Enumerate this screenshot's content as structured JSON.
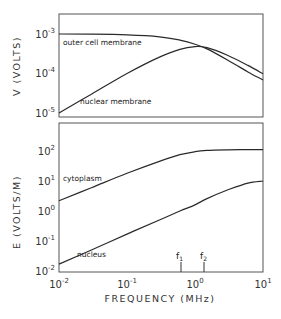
{
  "chart_data": [
    {
      "type": "line",
      "panel": "top",
      "title": "",
      "xlabel": "FREQUENCY (MHz)",
      "ylabel": "V (VOLTS)",
      "xscale": "log",
      "yscale": "log",
      "xlim": [
        0.01,
        10
      ],
      "ylim": [
        5e-06,
        0.0025
      ],
      "x_ticks": [
        "10^-2",
        "10^-1",
        "10^0",
        "10^1"
      ],
      "y_ticks": [
        "10^-3",
        "10^-4",
        "10^-5"
      ],
      "grid": false,
      "series": [
        {
          "name": "outer cell membrane",
          "x": [
            0.01,
            0.03,
            0.1,
            0.3,
            0.6,
            1.0,
            1.5,
            3,
            6,
            10
          ],
          "y": [
            0.001,
            0.00099,
            0.00095,
            0.00085,
            0.0007,
            0.00055,
            0.00042,
            0.00022,
            0.00011,
            6.8e-05
          ]
        },
        {
          "name": "nuclear membrane",
          "x": [
            0.01,
            0.03,
            0.1,
            0.3,
            0.6,
            1.0,
            1.5,
            3,
            6,
            10
          ],
          "y": [
            1e-05,
            3e-05,
            0.0001,
            0.00026,
            0.00041,
            0.00048,
            0.00045,
            0.00029,
            0.00016,
            9.8e-05
          ]
        }
      ]
    },
    {
      "type": "line",
      "panel": "bottom",
      "title": "",
      "xlabel": "FREQUENCY (MHz)",
      "ylabel": "E (VOLTS/M)",
      "xscale": "log",
      "yscale": "log",
      "xlim": [
        0.01,
        10
      ],
      "ylim": [
        0.01,
        500
      ],
      "x_ticks": [
        "10^-2",
        "10^-1",
        "10^0",
        "10^1"
      ],
      "y_ticks": [
        "10^2",
        "10^1",
        "10^0",
        "10^-1",
        "10^-2"
      ],
      "grid": false,
      "series": [
        {
          "name": "cytoplasm",
          "x": [
            0.01,
            0.03,
            0.1,
            0.3,
            0.6,
            1.0,
            1.5,
            3,
            6,
            10
          ],
          "y": [
            2.2,
            6.0,
            18,
            45,
            75,
            95,
            105,
            110,
            111,
            111
          ]
        },
        {
          "name": "nucleus",
          "x": [
            0.01,
            0.03,
            0.1,
            0.3,
            0.6,
            1.0,
            1.5,
            3,
            6,
            10
          ],
          "y": [
            0.017,
            0.05,
            0.17,
            0.5,
            1.0,
            1.6,
            2.6,
            5.0,
            8.5,
            10
          ]
        }
      ],
      "annotations": [
        {
          "label": "f1",
          "x": 0.62
        },
        {
          "label": "f2",
          "x": 1.36
        }
      ]
    }
  ],
  "labels": {
    "top_ylabel": "V (VOLTS)",
    "bottom_ylabel": "E (VOLTS/M)",
    "xlabel": "FREQUENCY (MHz)",
    "outer_membrane": "outer cell membrane",
    "nuclear_membrane": "nuclear membrane",
    "cytoplasm": "cytoplasm",
    "nucleus": "nucleus",
    "f1": "f",
    "f1_sub": "1",
    "f2": "f",
    "f2_sub": "2"
  },
  "ticks": {
    "x": [
      {
        "base": "10",
        "exp": "-2"
      },
      {
        "base": "10",
        "exp": "-1"
      },
      {
        "base": "10",
        "exp": "0"
      },
      {
        "base": "10",
        "exp": "1"
      }
    ],
    "top_y": [
      {
        "base": "10",
        "exp": "-3"
      },
      {
        "base": "10",
        "exp": "-4"
      },
      {
        "base": "10",
        "exp": "-5"
      }
    ],
    "bottom_y": [
      {
        "base": "10",
        "exp": "2"
      },
      {
        "base": "10",
        "exp": "1"
      },
      {
        "base": "10",
        "exp": "0"
      },
      {
        "base": "10",
        "exp": "-1"
      },
      {
        "base": "10",
        "exp": "-2"
      }
    ]
  }
}
